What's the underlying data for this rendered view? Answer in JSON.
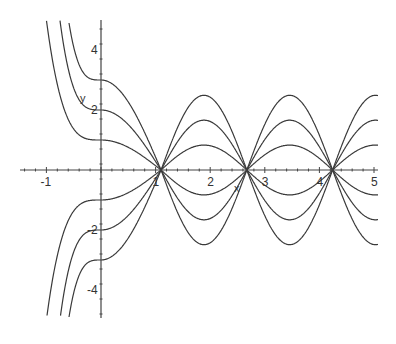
{
  "chart_data": {
    "type": "line",
    "title": "",
    "xlabel": "x",
    "ylabel": "y",
    "xlim": [
      -1.5,
      5
    ],
    "ylim": [
      -5,
      5
    ],
    "grid": false,
    "legend": null,
    "x_ticks": [
      -1,
      1,
      2,
      3,
      4,
      5
    ],
    "x_tick_labels": [
      "-1",
      "1",
      "2",
      "3",
      "4",
      "5"
    ],
    "y_ticks": [
      4,
      2,
      -2,
      -4
    ],
    "y_tick_labels": [
      "4",
      "2",
      "-2",
      "-4"
    ],
    "common_zeros": [
      1.1,
      2.67,
      4.24
    ],
    "series": [
      {
        "name": "c=3",
        "c": 3,
        "value_at_0": 3,
        "peak_amplitude_x_gt_0": 2.5
      },
      {
        "name": "c=2",
        "c": 2,
        "value_at_0": 2,
        "peak_amplitude_x_gt_0": 1.66
      },
      {
        "name": "c=1",
        "c": 1,
        "value_at_0": 1,
        "peak_amplitude_x_gt_0": 0.83
      },
      {
        "name": "c=-1",
        "c": -1,
        "value_at_0": -1,
        "peak_amplitude_x_gt_0": 0.83
      },
      {
        "name": "c=-2",
        "c": -2,
        "value_at_0": -2,
        "peak_amplitude_x_gt_0": 1.66
      },
      {
        "name": "c=-3",
        "c": -3,
        "value_at_0": -3,
        "peak_amplitude_x_gt_0": 2.5
      }
    ],
    "colors": {
      "curve": "#3a3a3a",
      "axis": "#444444",
      "background": "#ffffff"
    }
  },
  "layout": {
    "origin_px": [
      101,
      170
    ],
    "px_per_unit_x": 54.6,
    "px_per_unit_y": 30,
    "x_axis_px_range": [
      20,
      378
    ],
    "y_axis_px_range": [
      20,
      318
    ]
  }
}
